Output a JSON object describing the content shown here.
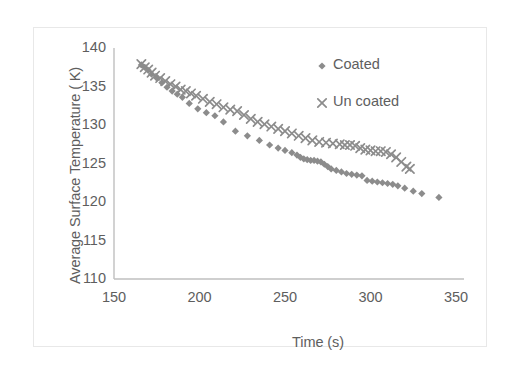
{
  "chart_data": {
    "type": "scatter",
    "title": "",
    "xlabel": "Time (s)",
    "ylabel": "Average Surface Temperature ( K)",
    "xlim": [
      150,
      350
    ],
    "ylim": [
      110,
      140
    ],
    "xticks": [
      150,
      200,
      250,
      300,
      350
    ],
    "yticks": [
      110,
      115,
      120,
      125,
      130,
      135,
      140
    ],
    "grid": false,
    "legend_position": "upper right",
    "marker_color": "#8c8c8c",
    "axis_color": "#bfbfbf",
    "text_color": "#5e5e5e",
    "series": [
      {
        "name": "Coated",
        "marker": "diamond",
        "color": "#8c8c8c",
        "x": [
          166,
          168,
          170,
          172,
          175,
          178,
          181,
          184,
          187,
          190,
          194,
          199,
          204,
          209,
          214,
          221,
          228,
          235,
          241,
          246,
          250,
          254,
          257,
          259,
          261,
          263,
          265,
          267,
          269,
          271,
          273,
          275,
          277,
          280,
          283,
          286,
          289,
          292,
          295,
          298,
          301,
          304,
          307,
          310,
          313,
          316,
          320,
          325,
          330,
          340
        ],
        "y": [
          137.8,
          137.5,
          137.1,
          136.6,
          136.1,
          135.5,
          134.9,
          134.4,
          134.0,
          133.6,
          132.8,
          132.1,
          131.6,
          131.2,
          130.4,
          129.2,
          128.6,
          128.0,
          127.4,
          127.0,
          126.7,
          126.4,
          126.1,
          125.8,
          125.6,
          125.5,
          125.4,
          125.4,
          125.3,
          125.2,
          124.9,
          124.6,
          124.3,
          124.1,
          123.9,
          123.7,
          123.6,
          123.5,
          123.4,
          122.8,
          122.7,
          122.6,
          122.5,
          122.4,
          122.3,
          122.1,
          121.8,
          121.4,
          121.1,
          120.6
        ]
      },
      {
        "name": "Un coated",
        "marker": "x",
        "color": "#8c8c8c",
        "x": [
          166,
          168,
          170,
          172,
          174,
          177,
          180,
          183,
          186,
          189,
          192,
          195,
          198,
          202,
          206,
          210,
          214,
          218,
          222,
          226,
          230,
          234,
          238,
          242,
          246,
          250,
          254,
          258,
          262,
          266,
          270,
          274,
          278,
          282,
          285,
          288,
          291,
          294,
          297,
          300,
          303,
          306,
          309,
          312,
          315,
          318,
          321,
          323
        ],
        "y": [
          137.9,
          137.5,
          137.2,
          136.8,
          136.4,
          136.1,
          135.7,
          135.3,
          135.0,
          134.6,
          134.4,
          134.1,
          133.8,
          133.4,
          133.0,
          132.7,
          132.3,
          132.0,
          131.8,
          131.3,
          130.8,
          130.4,
          130.1,
          129.8,
          129.5,
          129.2,
          128.9,
          128.6,
          128.3,
          128.0,
          127.8,
          127.7,
          127.6,
          127.5,
          127.4,
          127.4,
          127.3,
          127.0,
          126.8,
          126.7,
          126.6,
          126.6,
          126.5,
          126.2,
          125.8,
          125.2,
          124.6,
          124.3
        ]
      }
    ]
  },
  "legend": {
    "entries": [
      {
        "label": "Coated",
        "marker": "diamond"
      },
      {
        "label": "Un coated",
        "marker": "x"
      }
    ]
  }
}
